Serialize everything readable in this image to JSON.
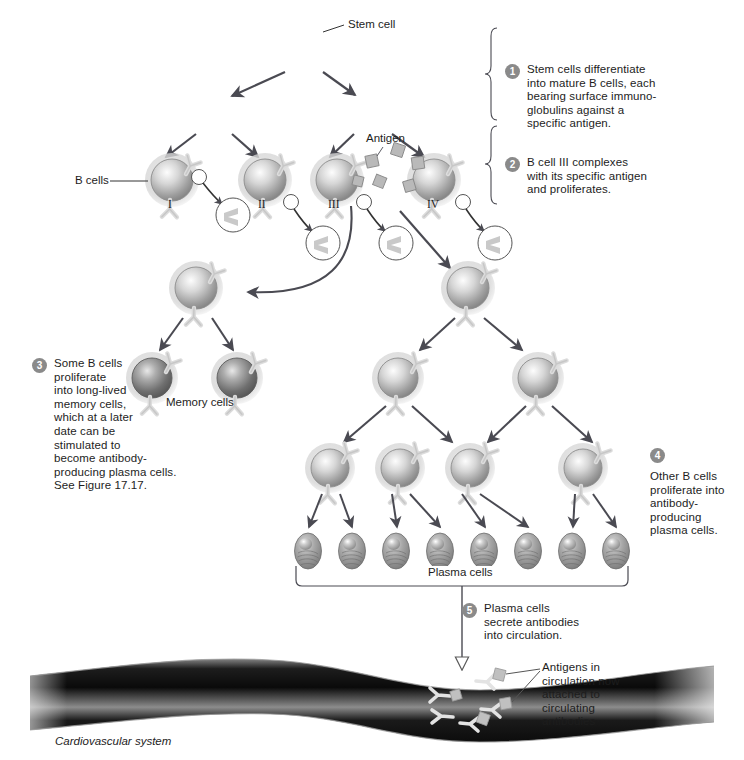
{
  "figure": {
    "background": "#ffffff",
    "ink": "#1d1d1d",
    "badge_color": "#8a8a8a",
    "arrow_color": "#4a4a52",
    "cell_light": "#d9d9d9",
    "cell_dark": "#8e8e8e"
  },
  "labels": {
    "stem_cell": "Stem cell",
    "antigen": "Antigen",
    "b_cells": "B cells",
    "memory_cells": "Memory cells",
    "plasma_cells": "Plasma cells",
    "cardiovascular_system": "Cardiovascular system",
    "antigens_circulation": "Antigens in\ncirculation now\nattached to\ncirculating\nantibodies"
  },
  "roman_numerals": [
    "I",
    "II",
    "III",
    "IV"
  ],
  "steps": [
    {
      "number": "1",
      "text": "Stem cells differentiate\ninto mature B cells, each\nbearing surface immuno-\nglobulins against a\nspecific antigen."
    },
    {
      "number": "2",
      "text": "B cell III complexes\nwith its specific antigen\nand proliferates."
    },
    {
      "number": "3",
      "text": "Some B cells\nproliferate\ninto long-lived\nmemory cells,\nwhich at a later\ndate can be\nstimulated to\nbecome antibody-\nproducing plasma cells.\nSee Figure 17.17."
    },
    {
      "number": "4",
      "text": "Other B cells\nproliferate into\nantibody-\nproducing\nplasma cells."
    },
    {
      "number": "5",
      "text": "Plasma cells\nsecrete antibodies\ninto circulation."
    }
  ],
  "cells": {
    "stem_cells": [
      {
        "id": "stem-root",
        "x": 303,
        "y": 48,
        "r": 34
      },
      {
        "id": "stem-left",
        "x": 213,
        "y": 110,
        "r": 31
      },
      {
        "id": "stem-right",
        "x": 372,
        "y": 110,
        "r": 31
      }
    ],
    "b_cells_row": [
      {
        "id": "b-cell-I",
        "x": 172,
        "y": 180,
        "numeral": "I"
      },
      {
        "id": "b-cell-II",
        "x": 265,
        "y": 180,
        "numeral": "II"
      },
      {
        "id": "b-cell-III",
        "x": 337,
        "y": 180,
        "numeral": "III"
      },
      {
        "id": "b-cell-IV",
        "x": 434,
        "y": 180,
        "numeral": "IV"
      }
    ],
    "activated": [
      {
        "id": "activated-left",
        "x": 196,
        "y": 288
      },
      {
        "id": "activated-right",
        "x": 468,
        "y": 288
      }
    ],
    "memory_cells": [
      {
        "id": "memory-1",
        "x": 152,
        "y": 378
      },
      {
        "id": "memory-2",
        "x": 237,
        "y": 378
      }
    ],
    "mid_b_cells": [
      {
        "id": "mid-b-1",
        "x": 398,
        "y": 378
      },
      {
        "id": "mid-b-2",
        "x": 538,
        "y": 378
      }
    ],
    "lower_b_cells": [
      {
        "id": "lower-b-1",
        "x": 330,
        "y": 468
      },
      {
        "id": "lower-b-2",
        "x": 400,
        "y": 468
      },
      {
        "id": "lower-b-3",
        "x": 470,
        "y": 468
      },
      {
        "id": "lower-b-4",
        "x": 583,
        "y": 468
      }
    ],
    "plasma_cells": [
      {
        "id": "plasma-1",
        "x": 308,
        "y": 551
      },
      {
        "id": "plasma-2",
        "x": 352,
        "y": 551
      },
      {
        "id": "plasma-3",
        "x": 396,
        "y": 551
      },
      {
        "id": "plasma-4",
        "x": 440,
        "y": 551
      },
      {
        "id": "plasma-5",
        "x": 484,
        "y": 551
      },
      {
        "id": "plasma-6",
        "x": 528,
        "y": 551
      },
      {
        "id": "plasma-7",
        "x": 572,
        "y": 551
      },
      {
        "id": "plasma-8",
        "x": 616,
        "y": 551
      }
    ],
    "antigen_squares": [
      {
        "x": 372,
        "y": 161
      },
      {
        "x": 398,
        "y": 150
      },
      {
        "x": 418,
        "y": 163
      },
      {
        "x": 380,
        "y": 182
      },
      {
        "x": 410,
        "y": 186
      }
    ]
  },
  "vessel": {
    "label": "Cardiovascular system",
    "top": 656,
    "height": 70
  }
}
